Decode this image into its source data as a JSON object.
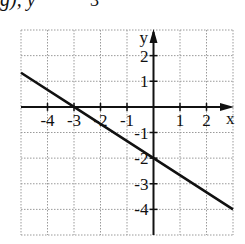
{
  "caption_fragment": {
    "left_text": "g), y",
    "fraction_denominator": "3"
  },
  "chart_data": {
    "type": "line",
    "title": "",
    "equation": "y = -(2/3)x - 2",
    "xlabel": "x",
    "ylabel": "y",
    "xlim": [
      -5,
      3
    ],
    "ylim": [
      -5,
      3
    ],
    "grid": true,
    "grid_style": "dotted",
    "x_ticks": [
      -4,
      -3,
      -2,
      -1,
      1,
      2
    ],
    "x_tick_labels": [
      "-4",
      "-3",
      "-2",
      "-1",
      "1",
      "2"
    ],
    "y_ticks": [
      2,
      1,
      -1,
      -2,
      -3,
      -4
    ],
    "y_tick_labels": [
      "2",
      "1",
      "-1",
      "-2",
      "-3",
      "-4"
    ],
    "series": [
      {
        "name": "line",
        "x": [
          -5,
          -3,
          0,
          3
        ],
        "y": [
          1.333,
          0,
          -2,
          -4
        ]
      }
    ],
    "key_points": {
      "x_intercept": [
        -3,
        0
      ],
      "y_intercept": [
        0,
        -2
      ]
    },
    "colors": {
      "line": "#111111",
      "grid": "#9a9a9a",
      "axes": "#111111"
    }
  }
}
